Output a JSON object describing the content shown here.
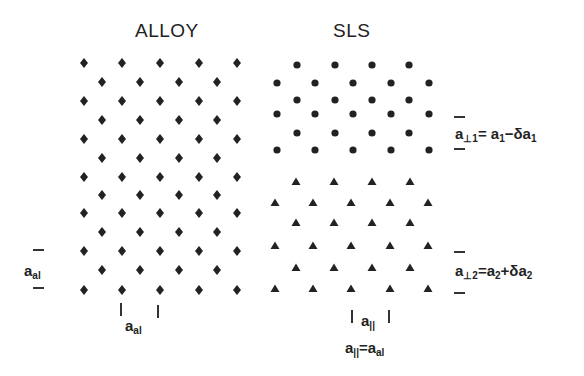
{
  "titles": {
    "alloy": "ALLOY",
    "sls": "SLS"
  },
  "labels": {
    "left_spacing": {
      "base": "a",
      "sub": "al"
    },
    "bottom_alloy": {
      "base": "a",
      "sub": "al"
    },
    "bottom_sls": {
      "base": "a",
      "sub": "||"
    },
    "bottom_sls_eq": {
      "lhs_base": "a",
      "lhs_sub": "||",
      "eq": "=",
      "rhs_base": "a",
      "rhs_sub": "al"
    },
    "perp1": {
      "lhs_base": "a",
      "lhs_sub": "⊥1",
      "eq": "= ",
      "rhs": "a",
      "rhs_sub": "1",
      "op": "−δa",
      "op_sub": "1"
    },
    "perp2": {
      "lhs_base": "a",
      "lhs_sub": "⊥2",
      "eq": "=",
      "rhs": "a",
      "rhs_sub": "2",
      "op": "+δa",
      "op_sub": "2"
    }
  },
  "colors": {
    "ink": "#222222",
    "background": "#ffffff"
  },
  "lattices": {
    "alloy": {
      "marker": "diamond",
      "rows_y": [
        63,
        82,
        101,
        120,
        139,
        158,
        177,
        195,
        213,
        232,
        251,
        270,
        290
      ],
      "wide_x": [
        84,
        122,
        160,
        199,
        237
      ],
      "narrow_x": [
        102,
        140,
        179,
        217
      ]
    },
    "sls_top": {
      "marker": "circle",
      "rows_y": [
        65,
        83,
        100,
        114,
        133,
        150
      ],
      "wide_x": [
        277,
        315,
        353,
        391,
        429
      ],
      "narrow_x": [
        297,
        335,
        372,
        409
      ],
      "first_row_narrow": true
    },
    "sls_bottom": {
      "marker": "triangle",
      "rows_y": [
        182,
        203,
        223,
        246,
        268,
        289
      ],
      "wide_x": [
        275,
        313,
        351,
        390,
        428
      ],
      "narrow_x": [
        296,
        334,
        372,
        410
      ],
      "first_row_narrow": true
    }
  }
}
